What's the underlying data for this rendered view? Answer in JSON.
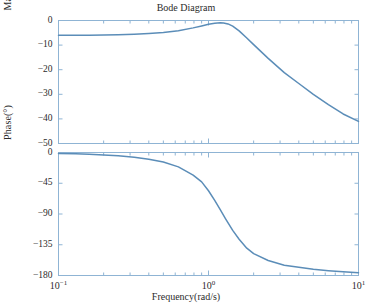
{
  "figure": {
    "title": "Bode Diagram",
    "background": "#ffffff",
    "curve_color": "#5b8db8",
    "axis_color": "#8fb4d4",
    "text_color": "#2b2b2b"
  },
  "axes": {
    "xlabel": "Frequency(rad/s)",
    "x_ticks": [
      {
        "label_base": "10",
        "label_exp": "-1",
        "value": 0.1
      },
      {
        "label_base": "10",
        "label_exp": "0",
        "value": 1
      },
      {
        "label_base": "10",
        "label_exp": "1",
        "value": 10
      }
    ],
    "magnitude": {
      "ylabel": "Magnitude(dB)",
      "y_ticks": [
        "0",
        "-10",
        "-20",
        "-30",
        "-40",
        "-50"
      ]
    },
    "phase": {
      "ylabel": "Phase(°)",
      "y_ticks": [
        "0",
        "-45",
        "-90",
        "-135",
        "-180"
      ]
    }
  },
  "chart_data": {
    "type": "line",
    "title": "Bode Diagram",
    "xlabel": "Frequency(rad/s)",
    "xscale": "log",
    "xlim": [
      0.1,
      10
    ],
    "grid": false,
    "legend": null,
    "subplots": [
      {
        "name": "magnitude",
        "ylabel": "Magnitude(dB)",
        "ylim": [
          -50,
          0
        ],
        "yticks": [
          0,
          -10,
          -20,
          -30,
          -40,
          -50
        ],
        "series": [
          {
            "name": "magnitude-response",
            "color": "#5b8db8",
            "x": [
              0.1,
              0.13,
              0.16,
              0.2,
              0.25,
              0.32,
              0.4,
              0.5,
              0.63,
              0.79,
              0.9,
              1.0,
              1.1,
              1.2,
              1.26,
              1.35,
              1.45,
              1.6,
              1.8,
              2.0,
              2.5,
              3.2,
              4.0,
              5.0,
              6.3,
              7.9,
              10.0
            ],
            "y": [
              -6.0,
              -6.0,
              -5.95,
              -5.9,
              -5.8,
              -5.6,
              -5.3,
              -4.9,
              -4.2,
              -3.0,
              -2.2,
              -1.5,
              -1.1,
              -0.95,
              -1.0,
              -1.4,
              -2.3,
              -4.2,
              -7.1,
              -9.8,
              -15.4,
              -21.2,
              -25.6,
              -30.0,
              -34.2,
              -38.0,
              -41.0
            ]
          }
        ]
      },
      {
        "name": "phase",
        "ylabel": "Phase(°)",
        "ylim": [
          -180,
          0
        ],
        "yticks": [
          0,
          -45,
          -90,
          -135,
          -180
        ],
        "series": [
          {
            "name": "phase-response",
            "color": "#5b8db8",
            "x": [
              0.1,
              0.13,
              0.16,
              0.2,
              0.25,
              0.32,
              0.4,
              0.5,
              0.63,
              0.79,
              0.9,
              1.0,
              1.1,
              1.2,
              1.3,
              1.45,
              1.6,
              1.8,
              2.0,
              2.5,
              3.2,
              4.0,
              5.0,
              6.3,
              7.9,
              10.0
            ],
            "y": [
              -1.5,
              -2.0,
              -2.6,
              -3.5,
              -4.8,
              -7.0,
              -9.8,
              -14.0,
              -21.0,
              -33.0,
              -43.0,
              -56.0,
              -70.0,
              -84.0,
              -97.0,
              -114.0,
              -127.0,
              -140.0,
              -148.0,
              -158.0,
              -165.0,
              -168.0,
              -171.0,
              -173.0,
              -174.5,
              -176.0
            ]
          }
        ]
      }
    ]
  }
}
